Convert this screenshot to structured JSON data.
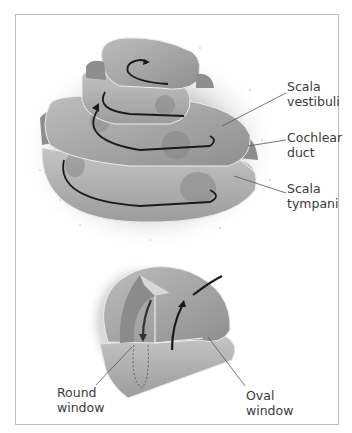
{
  "figure": {
    "top_diagram": {
      "name": "cochlea-spiral",
      "labels": [
        {
          "id": "scala-vestibuli",
          "text": "Scala\nvestibuli"
        },
        {
          "id": "cochlear-duct",
          "text": "Cochlear\nduct"
        },
        {
          "id": "scala-tympani",
          "text": "Scala\ntympani"
        }
      ]
    },
    "bottom_diagram": {
      "name": "cochlea-base",
      "labels": [
        {
          "id": "round-window",
          "text": "Round\nwindow"
        },
        {
          "id": "oval-window",
          "text": "Oval\nwindow"
        }
      ]
    },
    "colors": {
      "tissue": "#a8a8a8",
      "tissue_dark": "#7a7a7a",
      "tissue_light": "#c9c9c9",
      "arrow": "#1a1a1a",
      "leader": "#555555",
      "border": "#bdbdbd"
    }
  }
}
